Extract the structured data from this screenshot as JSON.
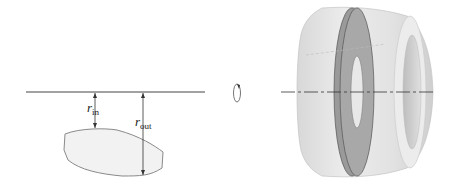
{
  "diagram": {
    "left_panel": {
      "axis_line": "horizontal axis of rotation",
      "labels": {
        "r_in": {
          "base": "r",
          "sub": "in"
        },
        "r_out": {
          "base": "r",
          "sub": "out"
        }
      },
      "region_fill": "#f2f2f2",
      "region_stroke": "#777777"
    },
    "middle": {
      "rotation_icon": "rotation-arrow-icon"
    },
    "right_panel": {
      "description": "3D solid with hole (washer slice shown)",
      "body_fill": "#e4e4e4",
      "slice_fill": "#9c9c9c"
    },
    "colors": {
      "line": "#333333",
      "shade_light": "#ececec",
      "shade_dark": "#8f8f8f"
    }
  }
}
